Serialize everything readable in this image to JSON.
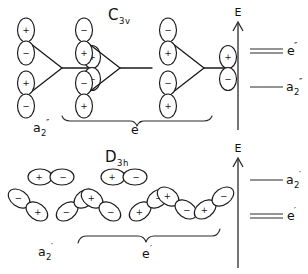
{
  "figure": {
    "title_top": "C",
    "background": "#ffffff",
    "ink_color": "#1a1a1a"
  },
  "panels": [
    {
      "id": "top",
      "point_group": {
        "letter": "C",
        "order": "3",
        "element": "v",
        "full": "C3v"
      },
      "energy_axis": {
        "label": "E",
        "direction": "up"
      },
      "levels": [
        {
          "label_letter": "e",
          "label_sub": "",
          "label_prime": "″",
          "full": "e″",
          "degeneracy": 2,
          "relative_energy": "higher"
        },
        {
          "label_letter": "a",
          "label_sub": "2",
          "label_prime": "″",
          "full": "a2″",
          "degeneracy": 1,
          "relative_energy": "lower"
        }
      ],
      "group_labels": [
        {
          "letter": "a",
          "sub": "2",
          "prime": "″",
          "full": "a2″",
          "braced": false
        },
        {
          "letter": "e",
          "sub": "",
          "prime": "″",
          "full": "e″",
          "braced": true
        }
      ],
      "orbital_sets": [
        {
          "name": "a2-double-prime-combination",
          "orbital_type": "p-perpendicular",
          "atoms": [
            {
              "position": "top-left",
              "orientation": "vertical",
              "upper_lobe": "+",
              "lower_lobe": "−"
            },
            {
              "position": "bottom-left",
              "orientation": "vertical",
              "upper_lobe": "+",
              "lower_lobe": "−"
            },
            {
              "position": "right",
              "orientation": "vertical",
              "upper_lobe": "+",
              "lower_lobe": "−"
            }
          ]
        },
        {
          "name": "e-double-prime-component-1",
          "orbital_type": "p-perpendicular",
          "atoms": [
            {
              "position": "top-left",
              "orientation": "vertical",
              "upper_lobe": "−",
              "lower_lobe": "+"
            },
            {
              "position": "bottom-left",
              "orientation": "vertical",
              "upper_lobe": "−",
              "lower_lobe": "+"
            },
            {
              "position": "right",
              "orientation": "none",
              "upper_lobe": "",
              "lower_lobe": ""
            }
          ]
        },
        {
          "name": "e-double-prime-component-2",
          "orbital_type": "p-perpendicular",
          "atoms": [
            {
              "position": "top-left",
              "orientation": "vertical",
              "upper_lobe": "−",
              "lower_lobe": "+"
            },
            {
              "position": "bottom-left",
              "orientation": "vertical",
              "upper_lobe": "−",
              "lower_lobe": "+"
            },
            {
              "position": "right",
              "orientation": "vertical",
              "upper_lobe": "+",
              "lower_lobe": "−"
            }
          ]
        }
      ]
    },
    {
      "id": "bottom",
      "point_group": {
        "letter": "D",
        "order": "3",
        "element": "h",
        "full": "D3h"
      },
      "energy_axis": {
        "label": "E",
        "direction": "up"
      },
      "levels": [
        {
          "label_letter": "a",
          "label_sub": "2",
          "label_prime": "′",
          "full": "a2′",
          "degeneracy": 1,
          "relative_energy": "higher"
        },
        {
          "label_letter": "e",
          "label_sub": "",
          "label_prime": "′",
          "full": "e′",
          "degeneracy": 2,
          "relative_energy": "lower"
        }
      ],
      "group_labels": [
        {
          "letter": "a",
          "sub": "2",
          "prime": "′",
          "full": "a2′",
          "braced": false
        },
        {
          "letter": "e",
          "sub": "",
          "prime": "′",
          "full": "e′",
          "braced": true
        }
      ],
      "orbital_sets": [
        {
          "name": "a2-prime-combination",
          "orbital_type": "p-in-plane",
          "atoms": [
            {
              "position": "top",
              "orientation": "horizontal",
              "first_lobe": "+",
              "second_lobe": "−"
            },
            {
              "position": "lower-left",
              "orientation": "tilted-down-right",
              "first_lobe": "−",
              "second_lobe": "+"
            },
            {
              "position": "lower-right",
              "orientation": "tilted-down-left",
              "first_lobe": "+",
              "second_lobe": "−"
            }
          ]
        },
        {
          "name": "e-prime-component-1",
          "orbital_type": "p-in-plane",
          "atoms": [
            {
              "position": "top",
              "orientation": "horizontal",
              "first_lobe": "+",
              "second_lobe": "−"
            },
            {
              "position": "lower-left",
              "orientation": "tilted-down-right",
              "first_lobe": "+",
              "second_lobe": "−"
            },
            {
              "position": "lower-right",
              "orientation": "tilted-down-left",
              "first_lobe": "−",
              "second_lobe": "+"
            }
          ]
        },
        {
          "name": "e-prime-component-2",
          "orbital_type": "p-in-plane",
          "atoms": [
            {
              "position": "lower-left",
              "orientation": "tilted-down-right",
              "first_lobe": "+",
              "second_lobe": "−"
            },
            {
              "position": "lower-right",
              "orientation": "tilted-down-left",
              "first_lobe": "−",
              "second_lobe": "+"
            }
          ]
        }
      ]
    }
  ],
  "signs": {
    "positive": "+",
    "negative": "−"
  },
  "axis_label": "E"
}
